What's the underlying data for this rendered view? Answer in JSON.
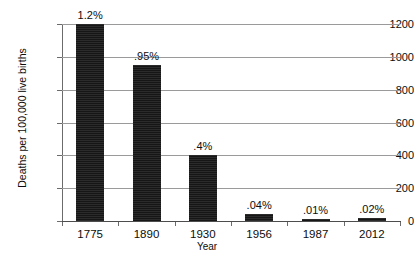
{
  "chart_data": {
    "type": "bar",
    "title": "",
    "xlabel": "Year",
    "ylabel": "Deaths per 100,000 live births",
    "categories": [
      "1775",
      "1890",
      "1930",
      "1956",
      "1987",
      "2012"
    ],
    "values": [
      1200,
      950,
      400,
      40,
      10,
      20
    ],
    "data_labels": [
      "1.2%",
      ".95%",
      ".4%",
      ".04%",
      ".01%",
      ".02%"
    ],
    "ylim": [
      0,
      1200
    ],
    "ytick_labels": [
      "0",
      "200",
      "400",
      "600",
      "800",
      "1000",
      "1200"
    ],
    "ytick_values": [
      0,
      200,
      400,
      600,
      800,
      1000,
      1200
    ],
    "grid": "horizontal",
    "legend": "none",
    "bar_color": "#252525",
    "gridline_color": "#9a9a9a",
    "axis_color": "#4d4d4d",
    "background": "#ffffff"
  }
}
